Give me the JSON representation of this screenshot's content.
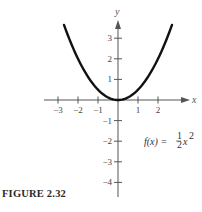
{
  "chart_data": {
    "type": "line",
    "title": "",
    "xlabel": "x",
    "ylabel": "y",
    "xlim": [
      -3.3,
      3.3
    ],
    "ylim": [
      -4.5,
      3.8
    ],
    "x_ticks": [
      -3,
      -2,
      -1,
      1,
      2
    ],
    "x_tick_labels": [
      "−3",
      "−2",
      "−1",
      "1",
      "2"
    ],
    "y_ticks": [
      3,
      2,
      1,
      -1,
      -2,
      -3,
      -4
    ],
    "y_tick_labels": [
      "3",
      "2",
      "1",
      "−1",
      "−2",
      "−3",
      "−4"
    ],
    "grid": false,
    "series": [
      {
        "name": "f(x) = ½x²",
        "function": "0.5*x^2",
        "x": [
          -2.7,
          -2.5,
          -2,
          -1.5,
          -1,
          -0.5,
          0,
          0.5,
          1,
          1.5,
          2,
          2.5,
          2.7
        ],
        "y": [
          3.645,
          3.125,
          2,
          1.125,
          0.5,
          0.125,
          0,
          0.125,
          0.5,
          1.125,
          2,
          3.125,
          3.645
        ]
      }
    ],
    "annotations": [
      {
        "text": "f(x) = ½x²",
        "x": 1.3,
        "y": -2
      }
    ]
  },
  "labels": {
    "x_axis": "x",
    "y_axis": "y",
    "function_prefix": "f(x) = ",
    "fraction_num": "1",
    "fraction_den": "2",
    "function_var": "x",
    "function_exp": "2",
    "caption": "FIGURE 2.32"
  },
  "style": {
    "curve_color": "#111111",
    "axis_color": "#555555"
  }
}
